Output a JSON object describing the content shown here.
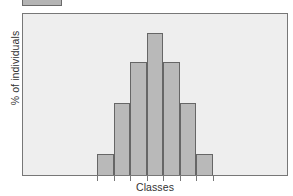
{
  "chart_data": {
    "type": "bar",
    "title": "",
    "subtitle": "",
    "xlabel": "Classes",
    "ylabel": "% of individuals",
    "categories": [
      "1",
      "2",
      "3",
      "4",
      "5",
      "6",
      "7"
    ],
    "values": [
      13,
      45,
      70,
      88,
      70,
      45,
      13
    ],
    "ylim": [
      0,
      100
    ],
    "xlim": [
      0,
      16
    ],
    "grid": false,
    "legend_position": "top-left",
    "legend_entries": [
      {
        "label": "",
        "color": "#b4b4b4"
      }
    ],
    "axis_tick_labels_x": [],
    "axis_tick_labels_y": [],
    "annotations": []
  },
  "figure": {
    "background_color": "#ffffff",
    "plot_background_color": "#eeeeee",
    "frame_color": "#777777",
    "bar_fill_color": "#b9b9b9",
    "bar_edge_color": "#666666",
    "text_color": "#333333"
  },
  "legend": {
    "swatch_name": "legend-swatch",
    "swatch_color": "#b4b4b4",
    "swatch_border": "#6a6a6a",
    "label": ""
  },
  "axes": {
    "x": {
      "label": "Classes",
      "tick_count": 8
    },
    "y": {
      "label": "% of individuals"
    }
  }
}
